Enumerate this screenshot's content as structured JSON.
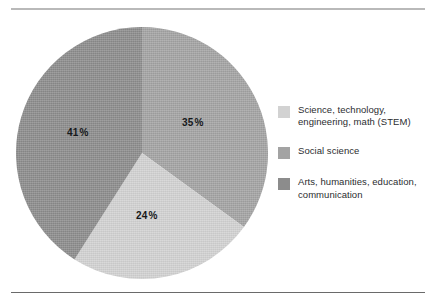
{
  "chart_data": {
    "type": "pie",
    "title": "",
    "categories": [
      "Science, technology, engineering, math (STEM)",
      "Social science",
      "Arts, humanities, education, communication"
    ],
    "values": [
      35,
      24,
      41
    ],
    "value_labels": [
      "35%",
      "24%",
      "41%"
    ],
    "unit": "percent",
    "total": 100,
    "start_angle_deg": 0,
    "direction": "clockwise",
    "legend_position": "right",
    "grid": false,
    "colors": [
      "#d2d2d2",
      "#a3a3a3",
      "#8c8c8c"
    ]
  },
  "pie": {
    "slices": [
      {
        "name": "stem",
        "percent_label": "35",
        "percent_sign": "%",
        "value": 35,
        "color": "#a3a3a3",
        "legend_key": "Science, technology, engineering, math (STEM)"
      },
      {
        "name": "social-science",
        "percent_label": "24",
        "percent_sign": "%",
        "value": 24,
        "color": "#d2d2d2",
        "legend_key": "Social science"
      },
      {
        "name": "arts-humanities",
        "percent_label": "41",
        "percent_sign": "%",
        "value": 41,
        "color": "#8c8c8c",
        "legend_key": "Arts, humanities, education, communication"
      }
    ]
  },
  "legend": {
    "items": [
      {
        "line1": "Science, technology,",
        "line2": "engineering, math (STEM)",
        "color": "#d2d2d2"
      },
      {
        "line1": "Social science",
        "line2": "",
        "color": "#a3a3a3"
      },
      {
        "line1": "Arts, humanities, education,",
        "line2": "communication",
        "color": "#8c8c8c"
      }
    ]
  }
}
